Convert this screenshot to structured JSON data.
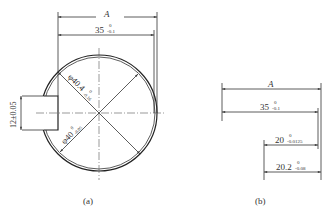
{
  "figure_a": {
    "caption": "(a)",
    "dim_A": "A",
    "dim_35": {
      "base": "35",
      "upper": "0",
      "lower": "-0.1"
    },
    "dim_dia_outer": {
      "base": "φ40.4",
      "upper": "0",
      "lower": "-0.16"
    },
    "dim_dia_inner": {
      "base": "φ40",
      "upper": "0",
      "lower": "-0.05"
    },
    "dim_key": "12±0.05"
  },
  "figure_b": {
    "caption": "(b)",
    "dim_A": "A",
    "dim_35": {
      "base": "35",
      "upper": "0",
      "lower": "-0.1"
    },
    "dim_20": {
      "base": "20",
      "upper": "0",
      "lower": "-0.0125"
    },
    "dim_20_2": {
      "base": "20.2",
      "upper": "0",
      "lower": "-0.08"
    }
  },
  "colors": {
    "line": "#333333",
    "background": "#ffffff"
  }
}
